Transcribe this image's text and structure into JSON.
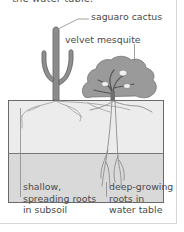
{
  "intro": {
    "cropped_text": "the water table."
  },
  "labels": {
    "saguaro": "saguaro cactus",
    "mesquite": "velvet mesquite",
    "shallow_roots": [
      "shallow,",
      "spreading roots",
      "in subsoil"
    ],
    "deep_roots": [
      "deep-growing",
      "roots in",
      "water table"
    ]
  },
  "layers": {
    "subsoil": {
      "name": "subsoil",
      "color": "#ebebeb"
    },
    "water_table": {
      "name": "water table",
      "color": "#d9d9d9"
    }
  },
  "colors": {
    "plant": "#8e8e8e",
    "plant_dark": "#6f6f6f",
    "outline": "#5a5a5a",
    "leader": "#8a8a8a",
    "roots": "#9a9a9a"
  }
}
